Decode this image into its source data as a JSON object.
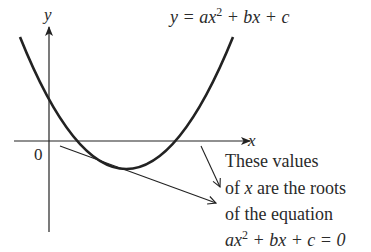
{
  "diagram": {
    "type": "quadratic-graph",
    "equation": {
      "lhs": "y = ax",
      "exp": "2",
      "rhs": " + bx + c"
    },
    "axes": {
      "x_label": "x",
      "y_label": "y",
      "origin_label": "0"
    },
    "annotation": {
      "line1": "These values",
      "line2_pre": "of ",
      "line2_var": "x",
      "line2_post": " are the roots",
      "line3": "of the equation",
      "line4_lhs": "ax",
      "line4_exp": "2",
      "line4_rhs": " + bx + c = 0"
    },
    "colors": {
      "stroke": "#222222",
      "text": "#2a2a2a",
      "background": "#ffffff"
    }
  }
}
